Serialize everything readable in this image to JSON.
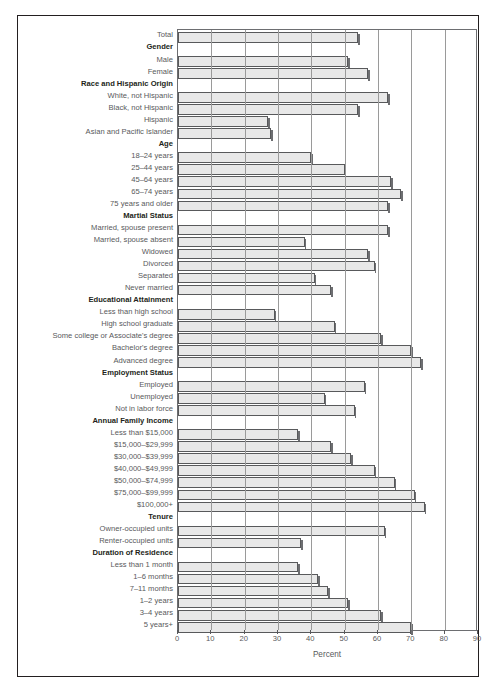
{
  "chart_data": {
    "type": "bar",
    "orientation": "horizontal",
    "title": "",
    "xlabel": "Percent",
    "ylabel": "",
    "xlim": [
      0,
      90
    ],
    "xticks": [
      0,
      10,
      20,
      30,
      40,
      50,
      60,
      70,
      80,
      90
    ],
    "grid": true,
    "legend": null,
    "bar_color": "#e8e8e8",
    "bar_edge_color": "#58595b",
    "categories": [
      "Total",
      "Gender",
      "Male",
      "Female",
      "Race and Hispanic Origin",
      "White, not Hispanic",
      "Black, not Hispanic",
      "Hispanic",
      "Asian and Pacific Islander",
      "Age",
      "18–24 years",
      "25–44 years",
      "45–64 years",
      "65–74 years",
      "75 years and older",
      "Martial Status",
      "Married, spouse present",
      "Married, spouse absent",
      "Widowed",
      "Divorced",
      "Separated",
      "Never married",
      "Educational Attainment",
      "Less than high school",
      "High school graduate",
      "Some college or Associate's degree",
      "Bachelor's degree",
      "Advanced degree",
      "Employment Status",
      "Employed",
      "Unemployed",
      "Not in labor force",
      "Annual Family Income",
      "Less than $15,000",
      "$15,000–$29,999",
      "$30,000–$39,999",
      "$40,000–$49,999",
      "$50,000–$74,999",
      "$75,000–$99,999",
      "$100,000+",
      "Tenure",
      "Owner-occupied units",
      "Renter-occupied units",
      "Duration of Residence",
      "Less than 1 month",
      "1–6 months",
      "7–11 months",
      "1–2 years",
      "3–4 years",
      "5 years+"
    ],
    "is_group_header": [
      false,
      true,
      false,
      false,
      true,
      false,
      false,
      false,
      false,
      true,
      false,
      false,
      false,
      false,
      false,
      true,
      false,
      false,
      false,
      false,
      false,
      false,
      true,
      false,
      false,
      false,
      false,
      false,
      true,
      false,
      false,
      false,
      true,
      false,
      false,
      false,
      false,
      false,
      false,
      false,
      true,
      false,
      false,
      true,
      false,
      false,
      false,
      false,
      false,
      false
    ],
    "values": [
      54,
      null,
      51,
      57,
      null,
      63,
      54,
      27,
      28,
      null,
      40,
      50,
      64,
      67,
      63,
      null,
      63,
      38,
      57,
      59,
      41,
      46,
      null,
      29,
      47,
      61,
      70,
      73,
      null,
      56,
      44,
      53,
      null,
      36,
      46,
      52,
      59,
      65,
      71,
      74,
      null,
      62,
      37,
      null,
      36,
      42,
      45,
      51,
      61,
      70
    ]
  }
}
